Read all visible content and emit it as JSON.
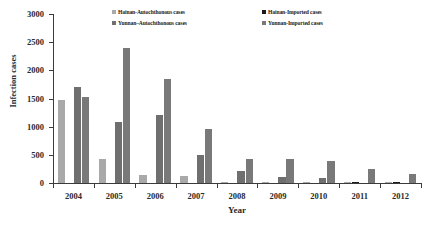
{
  "chart_data": {
    "type": "bar",
    "title": "",
    "xlabel": "Year",
    "ylabel": "Infection cases",
    "categories": [
      "2004",
      "2005",
      "2006",
      "2007",
      "2008",
      "2009",
      "2010",
      "2011",
      "2012"
    ],
    "ylim": [
      0,
      3000
    ],
    "yticks": [
      0,
      500,
      1000,
      1500,
      2000,
      2500,
      3000
    ],
    "ytick_labels": [
      "0",
      "500",
      "1000",
      "1500",
      "2000",
      "2500",
      "3000"
    ],
    "grid": false,
    "legend_position": "top-center",
    "series": [
      {
        "name": "Hainan-Autochthonous cases",
        "color": "#a9a9a9",
        "values": [
          1470,
          420,
          140,
          120,
          25,
          20,
          20,
          18,
          22
        ]
      },
      {
        "name": "Hainan-Imported cases",
        "color": "#1a1a1a",
        "values": [
          0,
          0,
          0,
          0,
          0,
          0,
          0,
          22,
          25
        ]
      },
      {
        "name": "Yunnan–Autochthonous cases",
        "color": "#6f6f6f",
        "values": [
          1700,
          1080,
          1215,
          495,
          210,
          100,
          85,
          0,
          0
        ]
      },
      {
        "name": "Yunnan-Imported cases",
        "color": "#797979",
        "values": [
          1530,
          2400,
          1850,
          950,
          435,
          425,
          395,
          250,
          160
        ]
      }
    ]
  },
  "legend": {
    "entries": [
      {
        "label": "Hainan-Autochthonous cases",
        "color": "#a9a9a9"
      },
      {
        "label": "Hainan-Imported cases",
        "color": "#1a1a1a"
      },
      {
        "label": "Yunnan–Autochthonous cases",
        "color": "#6f6f6f"
      },
      {
        "label": "Yunnan-Imported cases",
        "color": "#797979"
      }
    ]
  },
  "axes": {
    "y_title": "Infection cases",
    "x_title": "Year"
  }
}
